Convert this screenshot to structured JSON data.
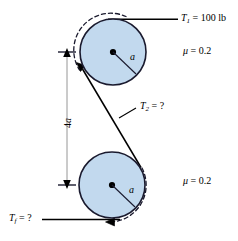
{
  "figure": {
    "colors": {
      "pulley_fill": "#c2d9ee",
      "outline": "#1a1a2e",
      "belt": "#000000",
      "dashed_belt": "#1a1a2e",
      "background": "#ffffff"
    },
    "labels": {
      "t1": {
        "symbol": "T",
        "subscript": "1",
        "equals": "=",
        "value": "100 lb"
      },
      "t2": {
        "symbol": "T",
        "subscript": "2",
        "equals": "=",
        "value": "?"
      },
      "tf": {
        "symbol": "T",
        "subscript": "f",
        "equals": "=",
        "value": "?"
      },
      "mu_top": {
        "symbol": "μ",
        "equals": "=",
        "value": "0.2"
      },
      "mu_bottom": {
        "symbol": "μ",
        "equals": "=",
        "value": "0.2"
      },
      "dimension": {
        "text": "4a",
        "number": "4",
        "variable": "a"
      },
      "radius_top": "a",
      "radius_bottom": "a"
    },
    "geometry": {
      "top_pulley": {
        "cx": 113,
        "cy": 52,
        "r": 33
      },
      "bottom_pulley": {
        "cx": 112,
        "cy": 185,
        "r": 33
      },
      "center_distance_label": "4a",
      "radius_label": "a"
    }
  }
}
